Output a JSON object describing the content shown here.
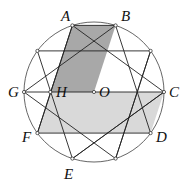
{
  "diagram": {
    "type": "geometry",
    "circle": {
      "cx": 94,
      "cy": 92,
      "r": 70
    },
    "points": {
      "C": [
        164,
        92
      ],
      "X": [
        150.6,
        50.9
      ],
      "B": [
        115.6,
        25.4
      ],
      "A": [
        72.4,
        25.4
      ],
      "Z": [
        37.4,
        50.9
      ],
      "G": [
        24,
        92
      ],
      "F": [
        37.4,
        133.1
      ],
      "E": [
        72.4,
        158.6
      ],
      "Y": [
        115.6,
        158.6
      ],
      "D": [
        150.6,
        133.1
      ],
      "O": [
        94,
        92
      ],
      "H": [
        50.3,
        92
      ]
    },
    "segments": [
      [
        "A",
        "B"
      ],
      [
        "Z",
        "X"
      ],
      [
        "G",
        "C"
      ],
      [
        "F",
        "D"
      ],
      [
        "C",
        "A"
      ],
      [
        "C",
        "E"
      ],
      [
        "X",
        "Y"
      ],
      [
        "B",
        "G"
      ],
      [
        "B",
        "D"
      ],
      [
        "A",
        "F"
      ],
      [
        "Z",
        "E"
      ],
      [
        "G",
        "Y"
      ],
      [
        "F",
        "A"
      ],
      [
        "E",
        "C"
      ],
      [
        "Y",
        "X"
      ]
    ],
    "shaded_regions": [
      {
        "name": "parallelogram-ABOH",
        "vertices": [
          "A",
          "B",
          "O",
          "H"
        ],
        "color": "#a8a8a8"
      },
      {
        "name": "parallelogram-HCDF",
        "vertices": [
          "H",
          "C",
          "D",
          "F"
        ],
        "color": "#d9d9d9"
      }
    ],
    "labels": [
      {
        "text": "A",
        "x": 61,
        "y": 21
      },
      {
        "text": "B",
        "x": 121,
        "y": 21
      },
      {
        "text": "G",
        "x": 8,
        "y": 97
      },
      {
        "text": "H",
        "x": 56,
        "y": 97
      },
      {
        "text": "O",
        "x": 99,
        "y": 97
      },
      {
        "text": "C",
        "x": 169,
        "y": 97
      },
      {
        "text": "F",
        "x": 22,
        "y": 142
      },
      {
        "text": "D",
        "x": 156,
        "y": 142
      },
      {
        "text": "E",
        "x": 64,
        "y": 179
      }
    ],
    "colors": {
      "line": "#222222",
      "circle": "#555555",
      "dot_fill": "#ffffff"
    }
  }
}
